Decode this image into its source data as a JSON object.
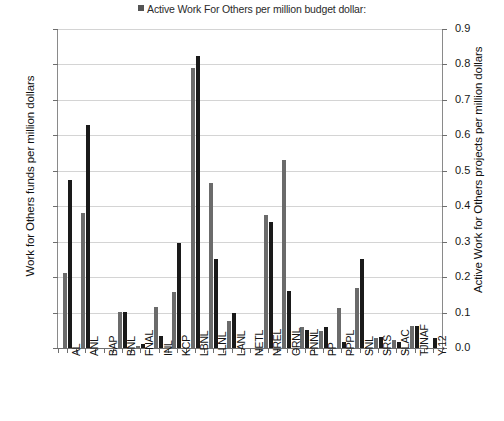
{
  "chart_data": {
    "type": "bar",
    "title": "",
    "legend": {
      "position": "top-center",
      "entries": [
        {
          "name": "Active Work For Others per million budget dollar:",
          "color": "#555555"
        }
      ]
    },
    "legend_label": "Active Work For Others per million budget dollar:",
    "xlabel": "",
    "ylabel": "Work for Others funds per million dollars",
    "y2label": "Active Work for Others projects per million dollars",
    "ylim": [
      0,
      90
    ],
    "y2lim": [
      0,
      0.9
    ],
    "yticks": [
      "0",
      "10",
      "20",
      "30",
      "40",
      "50",
      "60",
      "70",
      "80",
      "90"
    ],
    "y2ticks": [
      "0.0",
      "0.1",
      "0.2",
      "0.3",
      "0.4",
      "0.5",
      "0.6",
      "0.7",
      "0.8",
      "0.9"
    ],
    "grid": true,
    "categories": [
      "AL",
      "ANL",
      "BAP",
      "BNL",
      "FNAL",
      "INL",
      "KCP",
      "LBNL",
      "LLNL",
      "LANL",
      "NETL",
      "NREL",
      "ORNL",
      "PNNL",
      "PP",
      "PPPL",
      "SNL",
      "SRS",
      "SLAC",
      "TJNAF",
      "Y-12"
    ],
    "series": [
      {
        "name": "Work for Others funds per million dollars",
        "axis": "left",
        "color": "#6b6b6b",
        "values": [
          21.2,
          38.0,
          0.0,
          10.1,
          0.6,
          11.5,
          15.8,
          79.0,
          46.5,
          7.6,
          0.0,
          37.5,
          53.0,
          5.8,
          4.8,
          11.2,
          17.0,
          2.8,
          2.2,
          6.3,
          0.0
        ]
      },
      {
        "name": "Active Work For Others per million budget dollar:",
        "axis": "right",
        "color": "#1a1a1a",
        "values": [
          0.475,
          0.63,
          0.0,
          0.103,
          0.012,
          0.035,
          0.295,
          0.825,
          0.25,
          0.098,
          0.0,
          0.355,
          0.16,
          0.052,
          0.06,
          0.017,
          0.252,
          0.032,
          0.016,
          0.062,
          0.028
        ]
      }
    ]
  }
}
